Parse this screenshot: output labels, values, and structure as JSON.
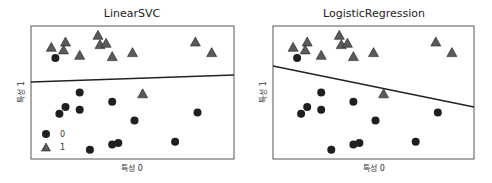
{
  "chart_data": [
    {
      "type": "scatter",
      "title": "LinearSVC",
      "xlabel": "특성 0",
      "ylabel": "특성 1",
      "grid": false,
      "legend": {
        "position": "lower left",
        "entries": [
          "0",
          "1"
        ]
      },
      "decision_boundary": {
        "x": [
          0,
          1
        ],
        "y": [
          0.58,
          0.63
        ]
      },
      "series": [
        {
          "name": "0",
          "marker": "circle",
          "color": "#1f1f1f",
          "points": [
            [
              0.12,
              0.76
            ],
            [
              0.24,
              0.5
            ],
            [
              0.17,
              0.39
            ],
            [
              0.14,
              0.34
            ],
            [
              0.24,
              0.37
            ],
            [
              0.4,
              0.43
            ],
            [
              0.51,
              0.29
            ],
            [
              0.82,
              0.35
            ],
            [
              0.4,
              0.11
            ],
            [
              0.43,
              0.12
            ],
            [
              0.71,
              0.13
            ],
            [
              0.29,
              0.07
            ]
          ]
        },
        {
          "name": "1",
          "marker": "triangle",
          "color": "#5a5a5a",
          "points": [
            [
              0.1,
              0.84
            ],
            [
              0.17,
              0.88
            ],
            [
              0.16,
              0.82
            ],
            [
              0.24,
              0.78
            ],
            [
              0.33,
              0.93
            ],
            [
              0.34,
              0.86
            ],
            [
              0.37,
              0.87
            ],
            [
              0.4,
              0.77
            ],
            [
              0.5,
              0.8
            ],
            [
              0.81,
              0.88
            ],
            [
              0.89,
              0.8
            ],
            [
              0.55,
              0.49
            ]
          ]
        }
      ]
    },
    {
      "type": "scatter",
      "title": "LogisticRegression",
      "xlabel": "특성 0",
      "ylabel": "특성 1",
      "grid": false,
      "decision_boundary": {
        "x": [
          0,
          1
        ],
        "y": [
          0.7,
          0.39
        ]
      },
      "series": [
        {
          "name": "0",
          "marker": "circle",
          "color": "#1f1f1f",
          "points": [
            [
              0.12,
              0.76
            ],
            [
              0.24,
              0.5
            ],
            [
              0.17,
              0.39
            ],
            [
              0.14,
              0.34
            ],
            [
              0.24,
              0.37
            ],
            [
              0.4,
              0.43
            ],
            [
              0.51,
              0.29
            ],
            [
              0.82,
              0.35
            ],
            [
              0.4,
              0.11
            ],
            [
              0.43,
              0.12
            ],
            [
              0.71,
              0.13
            ],
            [
              0.29,
              0.07
            ]
          ]
        },
        {
          "name": "1",
          "marker": "triangle",
          "color": "#5a5a5a",
          "points": [
            [
              0.1,
              0.84
            ],
            [
              0.17,
              0.88
            ],
            [
              0.16,
              0.82
            ],
            [
              0.24,
              0.78
            ],
            [
              0.33,
              0.93
            ],
            [
              0.34,
              0.86
            ],
            [
              0.37,
              0.87
            ],
            [
              0.4,
              0.77
            ],
            [
              0.5,
              0.8
            ],
            [
              0.81,
              0.88
            ],
            [
              0.89,
              0.8
            ],
            [
              0.55,
              0.49
            ]
          ]
        }
      ]
    }
  ],
  "plots": [
    {
      "title": "LinearSVC",
      "xlabel": "특성 0",
      "ylabel": "특성 1"
    },
    {
      "title": "LogisticRegression",
      "xlabel": "특성 0",
      "ylabel": "특성 1"
    }
  ],
  "legend": {
    "label0": "0",
    "label1": "1"
  },
  "colors": {
    "circle": "#1f1f1f",
    "triangle": "#5a5a5a",
    "frame": "#555555",
    "line": "#222222"
  }
}
